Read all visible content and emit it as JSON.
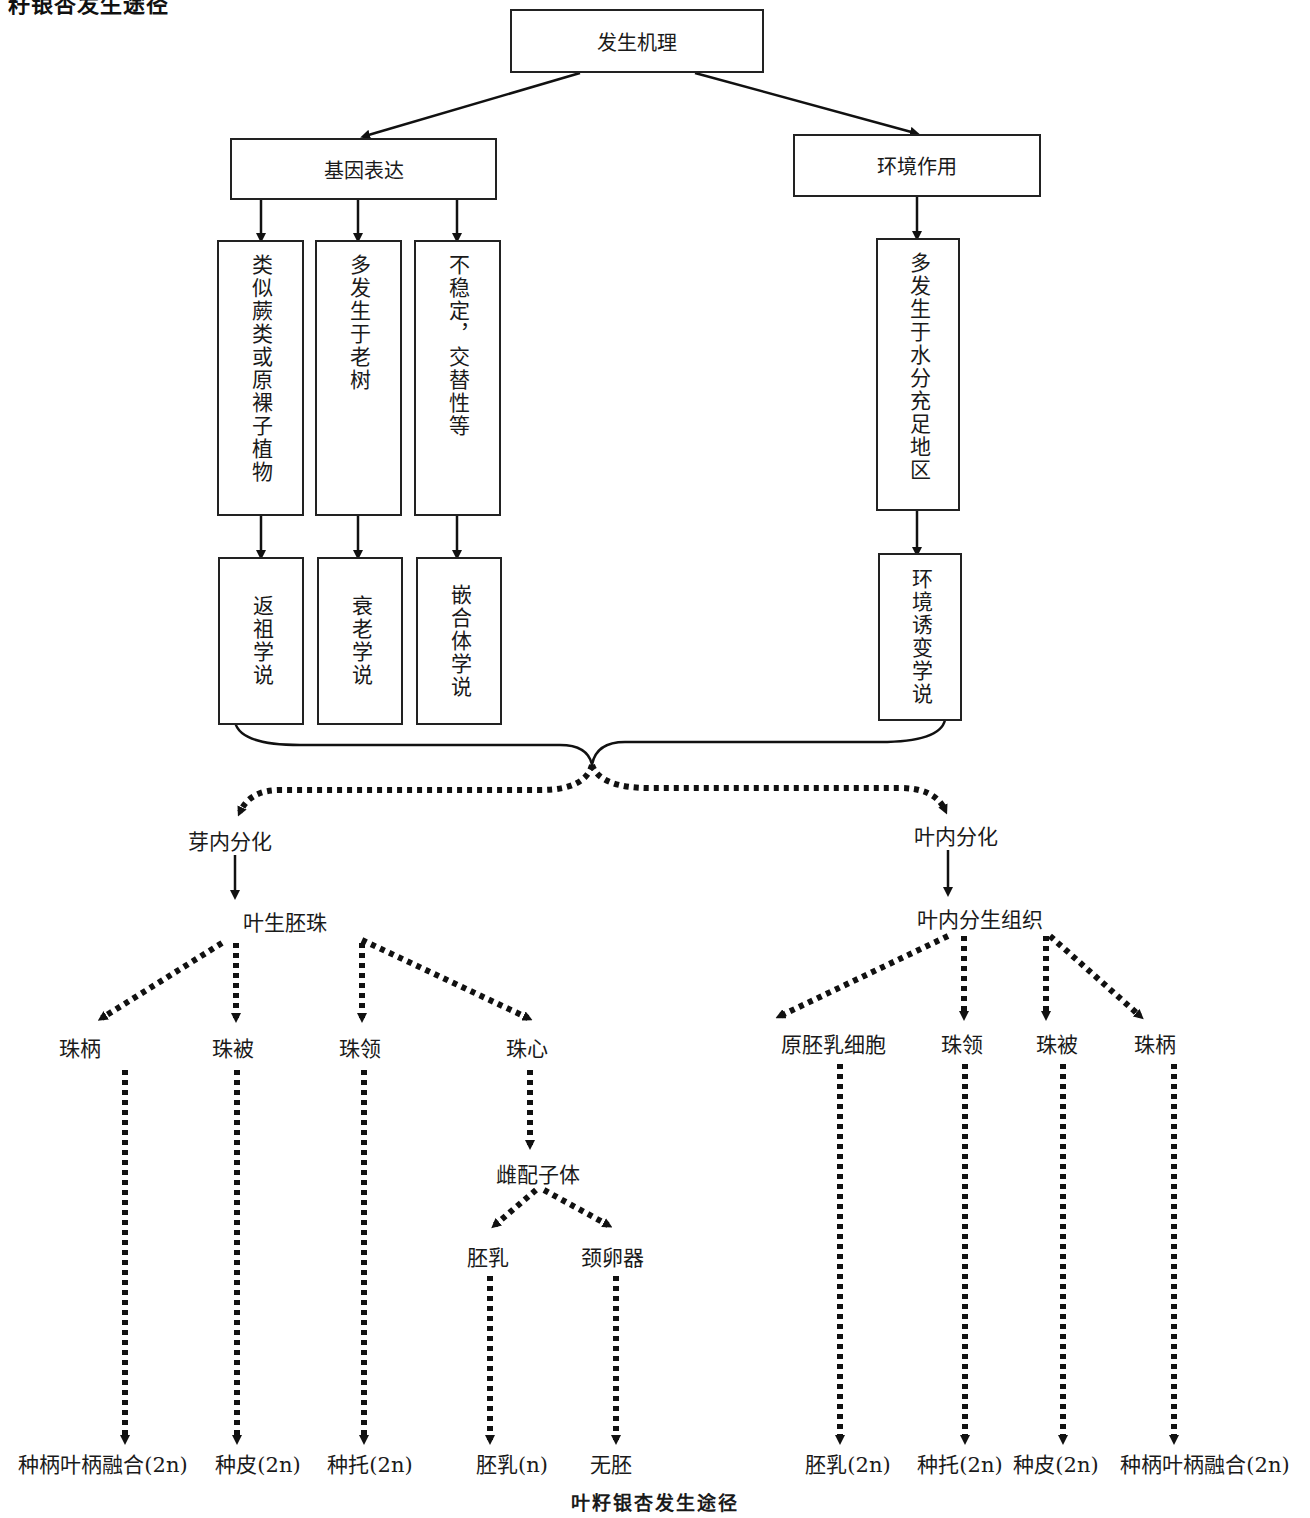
{
  "clipped_heading": "籽银杏发生途径",
  "caption": "叶籽银杏发生途径",
  "root": "发生机理",
  "branches": {
    "gene": {
      "label": "基因表达",
      "traits": [
        "类似蕨类或原裸子植物",
        "多发生于老树",
        "不稳定，交替性等"
      ],
      "theories": [
        "返祖学说",
        "衰老学说",
        "嵌合体学说"
      ]
    },
    "env": {
      "label": "环境作用",
      "trait": "多发生于水分充足地区",
      "theory": "环境诱变学说"
    }
  },
  "pathways": {
    "bud": {
      "label": "芽内分化",
      "intermediate": "叶生胚珠",
      "parts": [
        "珠柄",
        "珠被",
        "珠领",
        "珠心"
      ],
      "gametophyte": "雌配子体",
      "gametophyte_parts": [
        "胚乳",
        "颈卵器"
      ],
      "outcomes": [
        "种柄叶柄融合(2n)",
        "种皮(2n)",
        "种托(2n)",
        "胚乳(n)",
        "无胚"
      ]
    },
    "leaf": {
      "label": "叶内分化",
      "intermediate": "叶内分生组织",
      "parts": [
        "原胚乳细胞",
        "珠领",
        "珠被",
        "珠柄"
      ],
      "outcomes": [
        "胚乳(2n)",
        "种托(2n)",
        "种皮(2n)",
        "种柄叶柄融合(2n)"
      ]
    }
  }
}
